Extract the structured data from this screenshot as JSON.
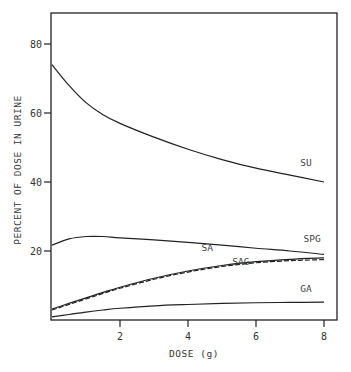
{
  "chart_data": {
    "type": "line",
    "title": "",
    "xlabel": "DOSE (g)",
    "ylabel": "PERCENT OF DOSE IN URINE",
    "xlim": [
      0,
      8.4
    ],
    "ylim": [
      0,
      88
    ],
    "xticks": [
      "2",
      "4",
      "6",
      "8"
    ],
    "yticks": [
      "20",
      "40",
      "60",
      "80"
    ],
    "grid": false,
    "legend": "inline labels",
    "x": [
      0,
      0.5,
      1,
      1.5,
      2,
      3,
      4,
      5,
      6,
      7,
      8
    ],
    "series": [
      {
        "name": "SU",
        "style": "solid",
        "label_pos": [
          7.3,
          44.5
        ],
        "values": [
          74,
          68,
          63,
          59.5,
          57,
          53,
          49.5,
          46.5,
          44,
          42,
          40
        ]
      },
      {
        "name": "SPG",
        "style": "solid",
        "label_pos": [
          7.4,
          22.5
        ],
        "values": [
          21.7,
          23.5,
          24.2,
          24.2,
          23.8,
          23.2,
          22.5,
          21.7,
          20.8,
          20,
          19
        ]
      },
      {
        "name": "SA",
        "style": "solid",
        "label_pos": [
          4.4,
          20
        ],
        "values": [
          3.2,
          4.8,
          6.4,
          8,
          9.5,
          12.1,
          14.2,
          15.8,
          16.9,
          17.6,
          18
        ]
      },
      {
        "name": "SAG",
        "style": "dashed",
        "label_pos": [
          5.3,
          16
        ],
        "values": [
          2.9,
          4.5,
          6.1,
          7.7,
          9.2,
          11.8,
          13.9,
          15.5,
          16.6,
          17.2,
          17.5
        ]
      },
      {
        "name": "GA",
        "style": "solid",
        "label_pos": [
          7.3,
          8
        ],
        "values": [
          0.9,
          1.6,
          2.3,
          2.9,
          3.4,
          4.1,
          4.5,
          4.8,
          5,
          5.1,
          5.2
        ]
      }
    ]
  }
}
